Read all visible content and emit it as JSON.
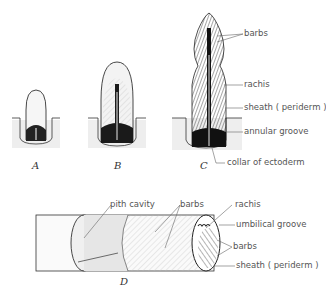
{
  "figure": {
    "panels": [
      {
        "id": "A",
        "caption": "A"
      },
      {
        "id": "B",
        "caption": "B"
      },
      {
        "id": "C",
        "caption": "C"
      },
      {
        "id": "D",
        "caption": "D"
      }
    ],
    "labels_c": {
      "barbs": "barbs",
      "rachis": "rachis",
      "sheath": "sheath ( periderm )",
      "annular_groove": "annular groove",
      "collar": "collar of ectoderm"
    },
    "labels_d": {
      "pith_cavity": "pith cavity",
      "barbs_top": "barbs",
      "rachis": "rachis",
      "umbilical_groove": "umbilical groove",
      "barbs_right": "barbs",
      "sheath": "sheath ( periderm )"
    },
    "colors": {
      "ink": "#1a1a1a",
      "label": "#555555",
      "shade": "#e8e8e8"
    }
  }
}
